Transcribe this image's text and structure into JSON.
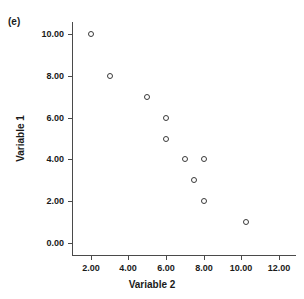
{
  "panel": {
    "letter": "(e)"
  },
  "chart_data": {
    "type": "scatter",
    "title": "",
    "subtitle": "",
    "xlabel": "Variable 2",
    "ylabel": "Variable 1",
    "xlim": [
      1.0,
      12.9
    ],
    "ylim": [
      -0.55,
      10.55
    ],
    "xticks": [
      2,
      4,
      6,
      8,
      10,
      12
    ],
    "yticks": [
      0,
      2,
      4,
      6,
      8,
      10
    ],
    "xtick_labels": [
      "2.00",
      "4.00",
      "6.00",
      "8.00",
      "10.00",
      "12.00"
    ],
    "ytick_labels": [
      "0.00",
      "2.00",
      "4.00",
      "6.00",
      "8.00",
      "10.00"
    ],
    "grid": false,
    "legend": null,
    "marker": "open-circle",
    "marker_color": "#3a3a3a",
    "series": [
      {
        "name": "Variable 1 vs Variable 2",
        "x": [
          2.0,
          3.0,
          5.0,
          6.0,
          6.0,
          7.0,
          8.0,
          7.5,
          8.0,
          10.25
        ],
        "y": [
          10.0,
          8.0,
          7.0,
          6.0,
          5.0,
          4.0,
          4.0,
          3.0,
          2.0,
          1.0
        ]
      }
    ],
    "annotations": [
      "(e)"
    ]
  },
  "colors": {
    "axis": "#4a4a4a",
    "text": "#1a1a1a",
    "background": "#ffffff",
    "marker": "#3a3a3a"
  }
}
